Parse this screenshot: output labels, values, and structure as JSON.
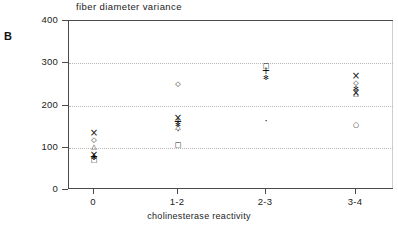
{
  "panel": {
    "letter": "B"
  },
  "chart_data": {
    "type": "scatter",
    "title": "fiber diameter variance",
    "xlabel": "cholinesterase reactivity",
    "ylabel": "",
    "categories": [
      "0",
      "1-2",
      "2-3",
      "3-4"
    ],
    "ylim": [
      0,
      400
    ],
    "yticks": [
      0,
      100,
      200,
      300,
      400
    ],
    "ytick_labels": [
      "0",
      "100",
      "200",
      "300",
      "400"
    ],
    "grid": "horizontal-dotted",
    "legend": "none",
    "series": [
      {
        "name": "group-0",
        "category": "0",
        "points": [
          {
            "value": 135,
            "marker": "x"
          },
          {
            "value": 118,
            "marker": "diamond"
          },
          {
            "value": 100,
            "marker": "triangle"
          },
          {
            "value": 85,
            "marker": "x"
          },
          {
            "value": 80,
            "marker": "plus"
          },
          {
            "value": 74,
            "marker": "asterisk"
          },
          {
            "value": 70,
            "marker": "square"
          }
        ]
      },
      {
        "name": "group-1-2",
        "category": "1-2",
        "points": [
          {
            "value": 250,
            "marker": "diamond"
          },
          {
            "value": 172,
            "marker": "x"
          },
          {
            "value": 163,
            "marker": "plus"
          },
          {
            "value": 153,
            "marker": "asterisk"
          },
          {
            "value": 148,
            "marker": "triangle"
          },
          {
            "value": 140,
            "marker": "dot"
          },
          {
            "value": 105,
            "marker": "square"
          }
        ]
      },
      {
        "name": "group-2-3",
        "category": "2-3",
        "points": [
          {
            "value": 292,
            "marker": "square"
          },
          {
            "value": 283,
            "marker": "plus"
          },
          {
            "value": 265,
            "marker": "asterisk"
          },
          {
            "value": 165,
            "marker": "dot"
          }
        ]
      },
      {
        "name": "group-3-4",
        "category": "3-4",
        "points": [
          {
            "value": 272,
            "marker": "x"
          },
          {
            "value": 253,
            "marker": "diamond"
          },
          {
            "value": 238,
            "marker": "asterisk"
          },
          {
            "value": 230,
            "marker": "x"
          },
          {
            "value": 226,
            "marker": "triangle"
          },
          {
            "value": 152,
            "marker": "circle"
          }
        ]
      }
    ]
  }
}
